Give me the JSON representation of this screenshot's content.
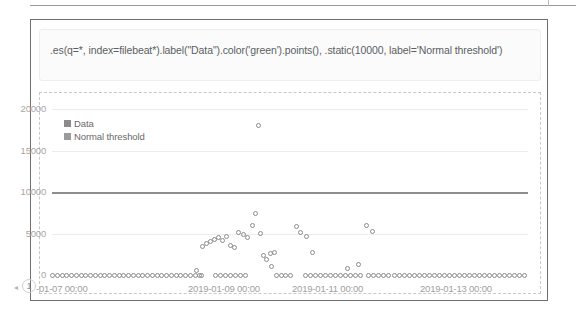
{
  "app": {
    "panel_title": "Timelion visualization panel"
  },
  "expression": {
    "value": ".es(q=*, index=filebeat*).label(\"Data\").color('green').points(), .static(10000, label='Normal threshold')",
    "placeholder": "Timelion expression"
  },
  "corner": {
    "badge_label": "1",
    "arrow_glyph": "◂"
  },
  "chart_data": {
    "type": "scatter",
    "title": "",
    "xlabel": "",
    "ylabel": "",
    "grid": true,
    "legend_position": "top-left",
    "ylim": [
      0,
      21500
    ],
    "yticks": [
      0,
      5000,
      10000,
      15000,
      20000
    ],
    "ytick_labels": [
      "0",
      "5000",
      "10000",
      "15000",
      "20000"
    ],
    "xtick_labels": [
      "-01-07 00:00",
      "2019-01-09 00:00",
      "2019-01-11 00:00",
      "2019-01-13 00:00"
    ],
    "xlim_labels": [
      "2019-01-07 00:00",
      "2019-01-13 00:00"
    ],
    "series": [
      {
        "name": "Data",
        "type": "points",
        "color": "#8b8b8b",
        "marker": "open-circle",
        "points": [
          [
            52,
            0
          ],
          [
            57,
            0
          ],
          [
            62,
            0
          ],
          [
            66,
            0
          ],
          [
            71,
            0
          ],
          [
            76,
            0
          ],
          [
            81,
            0
          ],
          [
            85,
            0
          ],
          [
            90,
            0
          ],
          [
            95,
            0
          ],
          [
            100,
            0
          ],
          [
            104,
            0
          ],
          [
            109,
            0
          ],
          [
            114,
            0
          ],
          [
            119,
            0
          ],
          [
            123,
            0
          ],
          [
            128,
            0
          ],
          [
            133,
            0
          ],
          [
            138,
            0
          ],
          [
            142,
            0
          ],
          [
            147,
            0
          ],
          [
            152,
            0
          ],
          [
            157,
            0
          ],
          [
            161,
            0
          ],
          [
            166,
            0
          ],
          [
            171,
            0
          ],
          [
            176,
            0
          ],
          [
            180,
            0
          ],
          [
            185,
            0
          ],
          [
            190,
            0
          ],
          [
            195,
            0
          ],
          [
            199,
            0
          ],
          [
            202,
            3500
          ],
          [
            206,
            3750
          ],
          [
            210,
            4050
          ],
          [
            214,
            4300
          ],
          [
            218,
            4500
          ],
          [
            222,
            4150
          ],
          [
            226,
            4700
          ],
          [
            230,
            3600
          ],
          [
            234,
            3300
          ],
          [
            238,
            5100
          ],
          [
            243,
            4950
          ],
          [
            247,
            4500
          ],
          [
            196,
            500
          ],
          [
            201,
            0
          ],
          [
            215,
            0
          ],
          [
            220,
            0
          ],
          [
            225,
            0
          ],
          [
            230,
            0
          ],
          [
            235,
            0
          ],
          [
            240,
            0
          ],
          [
            245,
            0
          ],
          [
            252,
            6000
          ],
          [
            255,
            7400
          ],
          [
            258,
            18000
          ],
          [
            260,
            5000
          ],
          [
            263,
            2400
          ],
          [
            266,
            1900
          ],
          [
            270,
            2600
          ],
          [
            274,
            2700
          ],
          [
            271,
            1000
          ],
          [
            276,
            0
          ],
          [
            281,
            0
          ],
          [
            285,
            0
          ],
          [
            290,
            0
          ],
          [
            296,
            5900
          ],
          [
            300,
            5100
          ],
          [
            306,
            4600
          ],
          [
            312,
            2700
          ],
          [
            305,
            0
          ],
          [
            310,
            0
          ],
          [
            315,
            0
          ],
          [
            320,
            0
          ],
          [
            325,
            0
          ],
          [
            330,
            0
          ],
          [
            335,
            0
          ],
          [
            340,
            0
          ],
          [
            345,
            0
          ],
          [
            350,
            0
          ],
          [
            355,
            0
          ],
          [
            360,
            0
          ],
          [
            347,
            800
          ],
          [
            358,
            1300
          ],
          [
            366,
            6000
          ],
          [
            372,
            5200
          ],
          [
            368,
            0
          ],
          [
            373,
            0
          ],
          [
            378,
            0
          ],
          [
            383,
            0
          ],
          [
            388,
            0
          ],
          [
            394,
            0
          ],
          [
            399,
            0
          ],
          [
            404,
            0
          ],
          [
            409,
            0
          ],
          [
            414,
            0
          ],
          [
            419,
            0
          ],
          [
            424,
            0
          ],
          [
            429,
            0
          ],
          [
            434,
            0
          ],
          [
            439,
            0
          ],
          [
            444,
            0
          ],
          [
            449,
            0
          ],
          [
            454,
            0
          ],
          [
            459,
            0
          ],
          [
            464,
            0
          ],
          [
            469,
            0
          ],
          [
            474,
            0
          ],
          [
            479,
            0
          ],
          [
            484,
            0
          ],
          [
            489,
            0
          ],
          [
            494,
            0
          ],
          [
            499,
            0
          ],
          [
            504,
            0
          ],
          [
            509,
            0
          ],
          [
            514,
            0
          ],
          [
            519,
            0
          ],
          [
            524,
            0
          ]
        ]
      },
      {
        "name": "Normal threshold",
        "type": "line",
        "color": "#8e8e8e",
        "value": 10000
      }
    ],
    "legend": [
      {
        "label": "Data",
        "color": "#8b8b8b"
      },
      {
        "label": "Normal threshold",
        "color": "#9b9b9b"
      }
    ]
  }
}
